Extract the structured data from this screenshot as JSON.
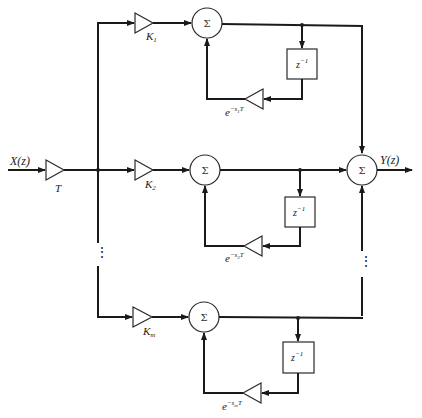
{
  "diagram": {
    "type": "block-diagram",
    "input": {
      "label": "X(z)"
    },
    "input_gain": {
      "label": "T"
    },
    "output": {
      "label": "Y(z)"
    },
    "output_summer": {
      "symbol": "Σ"
    },
    "ellipsis": "⋮",
    "branches": [
      {
        "gain_main": "K",
        "gain_sub": "1",
        "summer": "Σ",
        "delay": "z",
        "delay_exp": "−1",
        "feedback_base": "e",
        "feedback_exp_pre": "−s",
        "feedback_exp_sub": "1",
        "feedback_exp_post": "T"
      },
      {
        "gain_main": "K",
        "gain_sub": "2",
        "summer": "Σ",
        "delay": "z",
        "delay_exp": "−1",
        "feedback_base": "e",
        "feedback_exp_pre": "−s",
        "feedback_exp_sub": "2",
        "feedback_exp_post": "T"
      },
      {
        "gain_main": "K",
        "gain_sub": "m",
        "summer": "Σ",
        "delay": "z",
        "delay_exp": "−1",
        "feedback_base": "e",
        "feedback_exp_pre": "−s",
        "feedback_exp_sub": "m",
        "feedback_exp_post": "T"
      }
    ],
    "colors": {
      "line": "#1a1a1a",
      "background": "#ffffff"
    }
  }
}
